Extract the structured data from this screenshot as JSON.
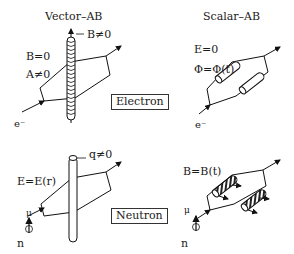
{
  "columns": {
    "left": {
      "title": "Vector–AB"
    },
    "right": {
      "title": "Scalar–AB"
    }
  },
  "rows": {
    "top": {
      "box_label": "Electron",
      "particle": "e⁻"
    },
    "bottom": {
      "box_label": "Neutron",
      "particle": "n",
      "moment": "μ"
    }
  },
  "labels": {
    "vector_electron": {
      "b_inside": "B≠0",
      "b_outside": "B=0",
      "a_outside": "A≠0"
    },
    "scalar_electron": {
      "e_field": "E=0",
      "potential": "Φ=Φ(t)"
    },
    "vector_neutron": {
      "charge": "q≠0",
      "e_field": "E=E(r)"
    },
    "scalar_neutron": {
      "b_field": "B=B(t)"
    }
  }
}
